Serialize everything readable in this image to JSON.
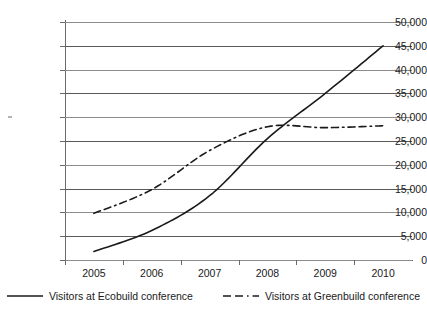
{
  "chart_data": {
    "type": "line",
    "title": "",
    "xlabel": "",
    "ylabel": "",
    "categories": [
      "2005",
      "2006",
      "2007",
      "2008",
      "2009",
      "2010"
    ],
    "ylim": [
      0,
      50000
    ],
    "yticks": [
      "0",
      "5,000",
      "10,000",
      "15,000",
      "20,000",
      "25,000",
      "30,000",
      "35,000",
      "40,000",
      "45,000",
      "50,000"
    ],
    "ytick_values": [
      0,
      5000,
      10000,
      15000,
      20000,
      25000,
      30000,
      35000,
      40000,
      45000,
      50000
    ],
    "grid": true,
    "legend_position": "bottom",
    "series": [
      {
        "name": "Visitors at Ecobuild conference",
        "style": "solid",
        "color": "#1a1a1a",
        "values": [
          1800,
          6200,
          13500,
          25500,
          35000,
          45000
        ]
      },
      {
        "name": "Visitors at Greenbuild conference",
        "style": "dashed",
        "color": "#1a1a1a",
        "values": [
          9800,
          14800,
          23000,
          28000,
          27800,
          28200
        ]
      }
    ]
  },
  "legend": {
    "entries": [
      {
        "label": "Visitors at Ecobuild conference",
        "style": "solid"
      },
      {
        "label": "Visitors at Greenbuild conference",
        "style": "dash-dot"
      }
    ]
  }
}
